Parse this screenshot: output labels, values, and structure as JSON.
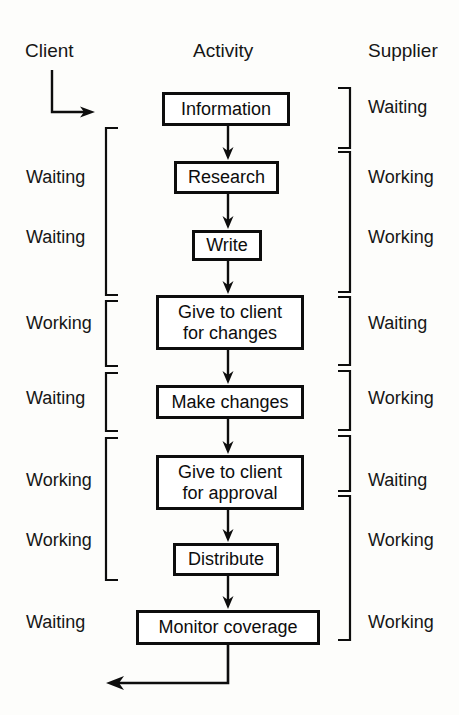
{
  "diagram": {
    "title_row": {
      "client": "Client",
      "activity": "Activity",
      "supplier": "Supplier"
    },
    "start_arrow": {
      "name": "client-entry-arrow"
    },
    "return_arrow": {
      "name": "feedback-return-arrow"
    },
    "activities": [
      {
        "id": "information",
        "label": "Information",
        "line1": "Information",
        "line2": "",
        "x": 162,
        "y": 92,
        "w": 128,
        "h": 34
      },
      {
        "id": "research",
        "label": "Research",
        "line1": "Research",
        "line2": "",
        "x": 174,
        "y": 161,
        "w": 105,
        "h": 33
      },
      {
        "id": "write",
        "label": "Write",
        "line1": "Write",
        "line2": "",
        "x": 192,
        "y": 230,
        "w": 70,
        "h": 31
      },
      {
        "id": "give-to-client-changes",
        "label": "Give to client for changes",
        "line1": "Give to client",
        "line2": "for changes",
        "x": 156,
        "y": 295,
        "w": 148,
        "h": 55
      },
      {
        "id": "make-changes",
        "label": "Make changes",
        "line1": "Make changes",
        "line2": "",
        "x": 156,
        "y": 385,
        "w": 148,
        "h": 34
      },
      {
        "id": "give-to-client-approval",
        "label": "Give to client for approval",
        "line1": "Give to client",
        "line2": "for approval",
        "x": 156,
        "y": 455,
        "w": 148,
        "h": 55
      },
      {
        "id": "distribute",
        "label": "Distribute",
        "line1": "Distribute",
        "line2": "",
        "x": 173,
        "y": 543,
        "w": 106,
        "h": 33
      },
      {
        "id": "monitor-coverage",
        "label": "Monitor coverage",
        "line1": "Monitor coverage",
        "line2": "",
        "x": 136,
        "y": 610,
        "w": 184,
        "h": 35
      }
    ],
    "client_states": [
      {
        "id": "client-state-research",
        "label": "Waiting",
        "x": 26,
        "y": 167
      },
      {
        "id": "client-state-write",
        "label": "Waiting",
        "x": 26,
        "y": 227
      },
      {
        "id": "client-state-changes",
        "label": "Working",
        "x": 26,
        "y": 313
      },
      {
        "id": "client-state-make",
        "label": "Waiting",
        "x": 26,
        "y": 388
      },
      {
        "id": "client-state-approval",
        "label": "Working",
        "x": 26,
        "y": 470
      },
      {
        "id": "client-state-distribute",
        "label": "Working",
        "x": 26,
        "y": 530
      },
      {
        "id": "client-state-monitor",
        "label": "Waiting",
        "x": 26,
        "y": 612
      }
    ],
    "supplier_states": [
      {
        "id": "supplier-state-information",
        "label": "Waiting",
        "x": 368,
        "y": 97
      },
      {
        "id": "supplier-state-research",
        "label": "Working",
        "x": 368,
        "y": 167
      },
      {
        "id": "supplier-state-write",
        "label": "Working",
        "x": 368,
        "y": 227
      },
      {
        "id": "supplier-state-changes",
        "label": "Waiting",
        "x": 368,
        "y": 313
      },
      {
        "id": "supplier-state-make",
        "label": "Working",
        "x": 368,
        "y": 388
      },
      {
        "id": "supplier-state-approval",
        "label": "Waiting",
        "x": 368,
        "y": 470
      },
      {
        "id": "supplier-state-distribute",
        "label": "Working",
        "x": 368,
        "y": 530
      },
      {
        "id": "supplier-state-monitor",
        "label": "Working",
        "x": 368,
        "y": 612
      }
    ],
    "client_brackets": [
      {
        "id": "client-bracket-1",
        "top": 128,
        "bottom": 295
      },
      {
        "id": "client-bracket-2",
        "top": 301,
        "bottom": 366
      },
      {
        "id": "client-bracket-3",
        "top": 373,
        "bottom": 431
      },
      {
        "id": "client-bracket-4",
        "top": 438,
        "bottom": 580
      }
    ],
    "supplier_brackets": [
      {
        "id": "supplier-bracket-1",
        "top": 88,
        "bottom": 148
      },
      {
        "id": "supplier-bracket-2",
        "top": 152,
        "bottom": 292
      },
      {
        "id": "supplier-bracket-3",
        "top": 297,
        "bottom": 365
      },
      {
        "id": "supplier-bracket-4",
        "top": 371,
        "bottom": 430
      },
      {
        "id": "supplier-bracket-5",
        "top": 436,
        "bottom": 491
      },
      {
        "id": "supplier-bracket-6",
        "top": 496,
        "bottom": 640
      }
    ],
    "connectors": [
      {
        "id": "connector-information-research",
        "from": "information",
        "to": "research",
        "x": 228,
        "y1": 126,
        "y2": 160
      },
      {
        "id": "connector-research-write",
        "from": "research",
        "to": "write",
        "x": 228,
        "y1": 194,
        "y2": 229
      },
      {
        "id": "connector-write-changes",
        "from": "write",
        "to": "give-to-client-changes",
        "x": 228,
        "y1": 261,
        "y2": 294
      },
      {
        "id": "connector-changes-make",
        "from": "give-to-client-changes",
        "to": "make-changes",
        "x": 228,
        "y1": 350,
        "y2": 384
      },
      {
        "id": "connector-make-approval",
        "from": "make-changes",
        "to": "give-to-client-approval",
        "x": 228,
        "y1": 419,
        "y2": 454
      },
      {
        "id": "connector-approval-distribute",
        "from": "give-to-client-approval",
        "to": "distribute",
        "x": 228,
        "y1": 510,
        "y2": 542
      },
      {
        "id": "connector-distribute-monitor",
        "from": "distribute",
        "to": "monitor-coverage",
        "x": 228,
        "y1": 576,
        "y2": 609
      }
    ],
    "colors": {
      "ink": "#0d0d0d",
      "paper": "#fdfdfb",
      "box_fill": "#ffffff"
    }
  }
}
